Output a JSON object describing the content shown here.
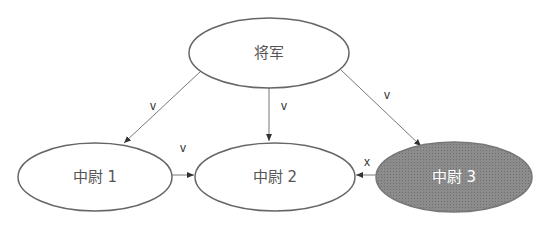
{
  "diagram": {
    "nodes": [
      {
        "id": "general",
        "label": "将军",
        "cx": 269,
        "cy": 53,
        "rx": 80,
        "ry": 35,
        "fill": "#ffffff",
        "text_color": "#555555"
      },
      {
        "id": "lt1",
        "label": "中尉 1",
        "cx": 95,
        "cy": 177,
        "rx": 77,
        "ry": 34,
        "fill": "#ffffff",
        "text_color": "#555555"
      },
      {
        "id": "lt2",
        "label": "中尉 2",
        "cx": 275,
        "cy": 177,
        "rx": 80,
        "ry": 34,
        "fill": "#ffffff",
        "text_color": "#555555"
      },
      {
        "id": "lt3",
        "label": "中尉 3",
        "cx": 454,
        "cy": 177,
        "rx": 78,
        "ry": 35,
        "fill": "#8a8a8a",
        "text_color": "#ffffff"
      }
    ],
    "edges": [
      {
        "from": "general",
        "to": "lt1",
        "label": "v"
      },
      {
        "from": "general",
        "to": "lt2",
        "label": "v"
      },
      {
        "from": "general",
        "to": "lt3",
        "label": "v"
      },
      {
        "from": "lt1",
        "to": "lt2",
        "label": "v"
      },
      {
        "from": "lt3",
        "to": "lt2",
        "label": "x"
      }
    ],
    "stroke_color": "#666666"
  }
}
